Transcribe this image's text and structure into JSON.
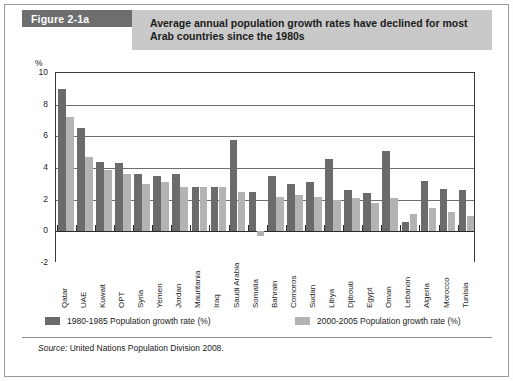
{
  "figure": {
    "tab_label": "Figure 2-1a",
    "title": "Average annual population growth rates have declined for most Arab countries since the 1980s",
    "unit_label": "%",
    "source_prefix": "Source:",
    "source_text": "United Nations Population Division 2008."
  },
  "colors": {
    "tab_background": "#6e6e6e",
    "title_background": "#c9c9c9",
    "series_1980_1985": "#6b6b6b",
    "series_2000_2005": "#b3b3b3",
    "axis": "#2b2b2b",
    "gridline": "#6f6f6f"
  },
  "legend": {
    "items": [
      {
        "label": "1980-1985 Population growth rate (%)",
        "color": "#6b6b6b"
      },
      {
        "label": "2000-2005 Population growth rate (%)",
        "color": "#b3b3b3"
      }
    ]
  },
  "chart_data": {
    "type": "bar",
    "title": "Average annual population growth rates have declined for most Arab countries since the 1980s",
    "xlabel": "",
    "ylabel": "%",
    "ylim": [
      -2,
      10
    ],
    "yticks": [
      -2,
      0,
      2,
      4,
      6,
      8,
      10
    ],
    "ytick_labels": [
      "-2",
      "0",
      "2",
      "4",
      "6",
      "8",
      "10"
    ],
    "grid": true,
    "legend_position": "bottom",
    "categories": [
      "Qatar",
      "UAE",
      "Kuwait",
      "OPT",
      "Syria",
      "Yemen",
      "Jordan",
      "Mauritania",
      "Iraq",
      "Saudi Arabia",
      "Somalia",
      "Bahrain",
      "Comoros",
      "Sudan",
      "Libya",
      "Djibouti",
      "Egypt",
      "Oman",
      "Lebanon",
      "Algeria",
      "Morocco",
      "Tunisia"
    ],
    "series": [
      {
        "name": "1980-1985 Population growth rate (%)",
        "color": "#6b6b6b",
        "values": [
          9.0,
          6.5,
          4.4,
          4.3,
          3.6,
          3.5,
          3.6,
          2.8,
          2.8,
          5.8,
          2.5,
          3.5,
          3.0,
          3.1,
          4.6,
          2.6,
          2.4,
          5.1,
          0.6,
          3.2,
          2.7,
          2.6
        ]
      },
      {
        "name": "2000-2005 Population growth rate (%)",
        "color": "#b3b3b3",
        "values": [
          7.2,
          4.7,
          3.9,
          3.6,
          3.0,
          3.1,
          2.8,
          2.8,
          2.8,
          2.5,
          -0.3,
          2.2,
          2.3,
          2.2,
          2.0,
          2.1,
          1.8,
          2.1,
          1.1,
          1.5,
          1.2,
          1.0
        ]
      }
    ]
  }
}
